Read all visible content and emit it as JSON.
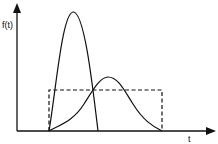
{
  "diagram": {
    "y_axis_label": "f(t)",
    "x_axis_label": "t",
    "curves": [
      {
        "name": "tall-narrow-pulse",
        "style": "solid"
      },
      {
        "name": "wide-skewed-pulse",
        "style": "solid"
      },
      {
        "name": "rectangular-pulse",
        "style": "dashed"
      }
    ],
    "colors": {
      "line": "#111111",
      "background": "#ffffff"
    }
  }
}
